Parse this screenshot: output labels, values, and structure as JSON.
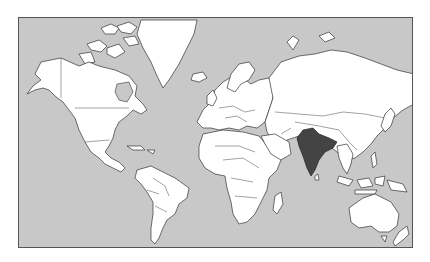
{
  "map": {
    "title": "World map with India highlighted",
    "projection": "Mercator",
    "highlighted_country": "India",
    "colors": {
      "ocean": "#c8c8c8",
      "land": "#ffffff",
      "highlight": "#444444",
      "borders": "#333333",
      "frame": "#555555"
    },
    "regions": [
      "North America",
      "Greenland",
      "South America",
      "Europe",
      "Africa",
      "Asia",
      "India",
      "Australia",
      "New Zealand",
      "Japan",
      "Indonesia"
    ]
  }
}
